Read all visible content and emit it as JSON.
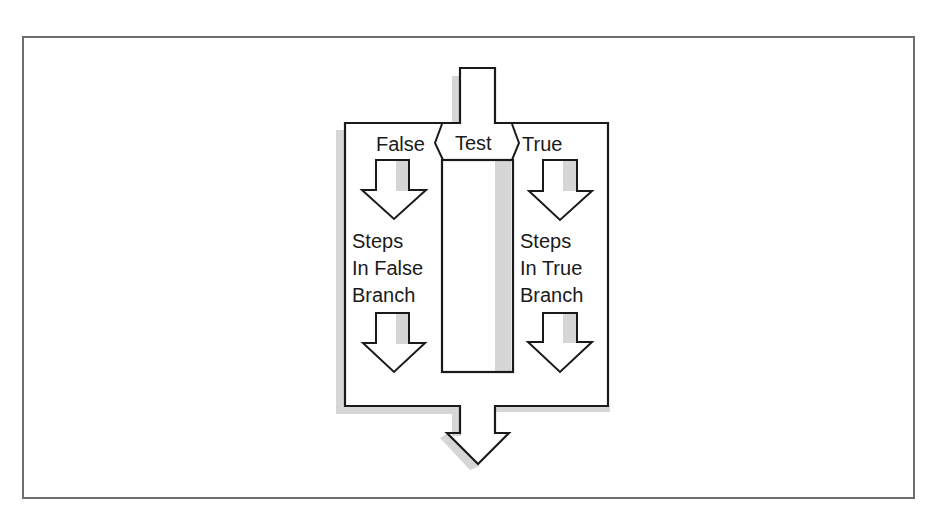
{
  "diagram": {
    "type": "flowchart-if-then-else",
    "test_label": "Test",
    "false_label": "False",
    "true_label": "True",
    "false_branch": {
      "lines": [
        "Steps",
        "In False",
        "Branch"
      ]
    },
    "true_branch": {
      "lines": [
        "Steps",
        "In True",
        "Branch"
      ]
    },
    "colors": {
      "stroke": "#1a1a1a",
      "shadow": "#d4d4d4",
      "frame": "#6e6e6e",
      "fill": "#ffffff"
    }
  }
}
